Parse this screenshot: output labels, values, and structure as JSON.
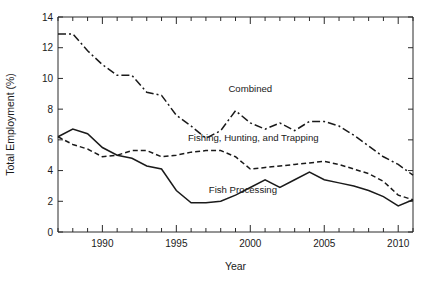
{
  "chart_data": {
    "type": "line",
    "title": "",
    "xlabel": "Year",
    "ylabel": "Total Employment (%)",
    "xlim": [
      1987,
      2011
    ],
    "ylim": [
      0,
      14
    ],
    "ytick_labels": [
      "0",
      "2",
      "4",
      "6",
      "8",
      "10",
      "12",
      "14"
    ],
    "ytick_values": [
      0,
      2,
      4,
      6,
      8,
      10,
      12,
      14
    ],
    "xtick_labels": [
      "1990",
      "1995",
      "2000",
      "2005",
      "2010"
    ],
    "xtick_values": [
      1990,
      1995,
      2000,
      2005,
      2010
    ],
    "xtick_minor_step": 1,
    "grid": false,
    "legend_position": "inline-annotations",
    "x": [
      1987,
      1988,
      1989,
      1990,
      1991,
      1992,
      1993,
      1994,
      1995,
      1996,
      1997,
      1998,
      1999,
      2000,
      2001,
      2002,
      2003,
      2004,
      2005,
      2006,
      2007,
      2008,
      2009,
      2010,
      2011
    ],
    "series": [
      {
        "name": "Combined",
        "style": "dash-dot",
        "label": "Combined",
        "label_x": 2000.0,
        "label_y": 9.1,
        "values": [
          12.9,
          12.9,
          11.8,
          10.9,
          10.2,
          10.2,
          9.1,
          8.9,
          7.6,
          6.9,
          6.1,
          6.6,
          7.9,
          7.1,
          6.7,
          7.1,
          6.6,
          7.2,
          7.2,
          6.9,
          6.3,
          5.6,
          4.9,
          4.4,
          3.7
        ]
      },
      {
        "name": "Fishing, Hunting, and Trapping",
        "style": "dashed",
        "label": "Fishing, Hunting, and Trapping",
        "label_x": 2000.2,
        "label_y": 5.95,
        "values": [
          6.2,
          5.7,
          5.4,
          4.9,
          5.0,
          5.3,
          5.3,
          4.9,
          5.0,
          5.2,
          5.3,
          5.3,
          4.9,
          4.1,
          4.2,
          4.3,
          4.4,
          4.5,
          4.6,
          4.4,
          4.1,
          3.8,
          3.3,
          2.4,
          2.1
        ]
      },
      {
        "name": "Fish Processing",
        "style": "solid",
        "label": "Fish Processing",
        "label_x": 1999.5,
        "label_y": 2.55,
        "values": [
          6.2,
          6.7,
          6.4,
          5.5,
          5.0,
          4.8,
          4.3,
          4.1,
          2.7,
          1.9,
          1.9,
          2.0,
          2.4,
          2.9,
          3.4,
          2.9,
          3.4,
          3.9,
          3.4,
          3.2,
          3.0,
          2.7,
          2.3,
          1.7,
          2.1
        ]
      }
    ]
  },
  "figure": {
    "background": "#ffffff",
    "line_color": "#1a1a1a",
    "axis_color": "#2b2b2b"
  }
}
